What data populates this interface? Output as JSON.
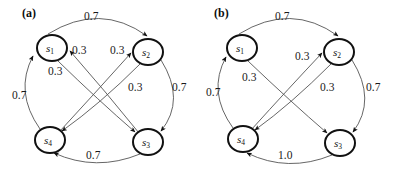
{
  "figure": {
    "width": 398,
    "height": 172,
    "background": "#ffffff",
    "edge_color": "#555555",
    "node_stroke": "#111111",
    "node_fill": "#ffffff",
    "text_color": "#111111"
  },
  "panels": [
    {
      "id": "a",
      "label": "(a)",
      "nodes": [
        {
          "id": "s1",
          "name": "s",
          "sub": "1",
          "cx": 52,
          "cy": 48,
          "rx": 15,
          "ry": 13
        },
        {
          "id": "s2",
          "name": "s",
          "sub": "2",
          "cx": 148,
          "cy": 52,
          "rx": 15,
          "ry": 13
        },
        {
          "id": "s4",
          "name": "s",
          "sub": "4",
          "cx": 50,
          "cy": 140,
          "rx": 15,
          "ry": 13
        },
        {
          "id": "s3",
          "name": "s",
          "sub": "3",
          "cx": 148,
          "cy": 142,
          "rx": 15,
          "ry": 13
        }
      ],
      "edges": [
        {
          "from": "s1",
          "to": "s2",
          "weight": "0.7",
          "label_x": 84,
          "label_y": 11
        },
        {
          "from": "s3",
          "to": "s1",
          "weight": "0.3",
          "label_x": 72,
          "label_y": 45
        },
        {
          "from": "s4",
          "to": "s2",
          "weight": "0.3",
          "label_x": 110,
          "label_y": 45
        },
        {
          "from": "s1",
          "to": "s3",
          "weight": "0.3",
          "label_x": 48,
          "label_y": 66
        },
        {
          "from": "s2",
          "to": "s4",
          "weight": "0.3",
          "label_x": 128,
          "label_y": 82
        },
        {
          "from": "s2",
          "to": "s3",
          "weight": "0.7",
          "label_x": 172,
          "label_y": 82
        },
        {
          "from": "s4",
          "to": "s1",
          "weight": "0.7",
          "label_x": 12,
          "label_y": 90
        },
        {
          "from": "s3",
          "to": "s4",
          "weight": "0.7",
          "label_x": 86,
          "label_y": 150
        }
      ]
    },
    {
      "id": "b",
      "label": "(b)",
      "nodes": [
        {
          "id": "s1",
          "name": "s",
          "sub": "1",
          "cx": 43,
          "cy": 48,
          "rx": 15,
          "ry": 13
        },
        {
          "id": "s2",
          "name": "s",
          "sub": "2",
          "cx": 140,
          "cy": 52,
          "rx": 15,
          "ry": 13
        },
        {
          "id": "s4",
          "name": "s",
          "sub": "4",
          "cx": 44,
          "cy": 139,
          "rx": 15,
          "ry": 13
        },
        {
          "id": "s3",
          "name": "s",
          "sub": "3",
          "cx": 141,
          "cy": 143,
          "rx": 15,
          "ry": 13
        }
      ],
      "edges": [
        {
          "from": "s1",
          "to": "s2",
          "weight": "0.7",
          "label_x": 76,
          "label_y": 11
        },
        {
          "from": "s4",
          "to": "s2",
          "weight": "0.3",
          "label_x": 96,
          "label_y": 51
        },
        {
          "from": "s1",
          "to": "s3",
          "weight": "0.3",
          "label_x": 43,
          "label_y": 72
        },
        {
          "from": "s2",
          "to": "s4",
          "weight": "0.3",
          "label_x": 121,
          "label_y": 82
        },
        {
          "from": "s2",
          "to": "s3",
          "weight": "0.7",
          "label_x": 167,
          "label_y": 82
        },
        {
          "from": "s4",
          "to": "s1",
          "weight": "0.7",
          "label_x": 7,
          "label_y": 87
        },
        {
          "from": "s3",
          "to": "s4",
          "weight": "1.0",
          "label_x": 79,
          "label_y": 150
        }
      ]
    }
  ]
}
